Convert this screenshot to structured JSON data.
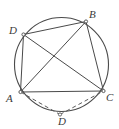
{
  "figure": {
    "name": "cyclic-quadrilateral-diagram",
    "stroke_color": "#4a4a4a",
    "dashed_color": "#5a5a5a",
    "label_color": "#3a3a3a",
    "background_color": "#ffffff",
    "circle": {
      "cx": 61.5,
      "cy": 64.5,
      "r": 47
    },
    "points": [
      {
        "id": "A",
        "label": "A",
        "x": 20.5,
        "y": 92.0,
        "label_x": 6,
        "label_y": 93
      },
      {
        "id": "B",
        "label": "B",
        "x": 86.0,
        "y": 21.5,
        "label_x": 89,
        "label_y": 9
      },
      {
        "id": "C",
        "label": "C",
        "x": 103.5,
        "y": 91.0,
        "label_x": 106,
        "label_y": 92
      },
      {
        "id": "D_top",
        "label": "D",
        "x": 23.5,
        "y": 34.5,
        "label_x": 9,
        "label_y": 25
      },
      {
        "id": "D_bottom",
        "label": "D",
        "x": 60.0,
        "y": 114.5,
        "label_x": 58,
        "label_y": 116
      }
    ],
    "solid_segments": [
      {
        "name": "segment-D-B",
        "from": "D_top",
        "to": "B"
      },
      {
        "name": "segment-B-C",
        "from": "B",
        "to": "C"
      },
      {
        "name": "segment-A-C",
        "from": "A",
        "to": "C"
      },
      {
        "name": "segment-A-D",
        "from": "A",
        "to": "D_top"
      },
      {
        "name": "segment-A-B-diagonal",
        "from": "A",
        "to": "B"
      },
      {
        "name": "segment-D-C-diagonal",
        "from": "D_top",
        "to": "C"
      }
    ],
    "dashed_segments": [
      {
        "name": "segment-A-Dbottom",
        "from": "A",
        "to": "D_bottom"
      },
      {
        "name": "segment-Dbottom-C",
        "from": "D_bottom",
        "to": "C"
      }
    ]
  }
}
